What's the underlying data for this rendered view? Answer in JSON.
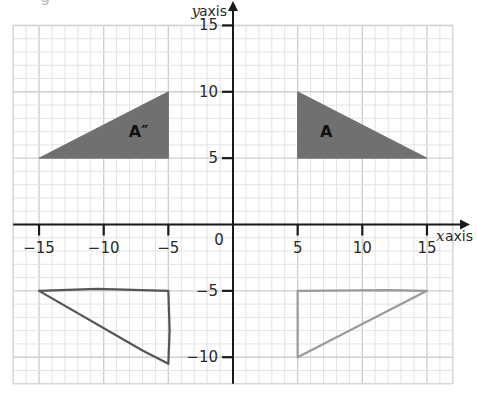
{
  "header": {
    "stray_text": "g"
  },
  "chart_data": {
    "type": "scatter",
    "title": "",
    "xlabel": {
      "var": "x",
      "text": "axis"
    },
    "ylabel": {
      "var": "y",
      "text": "axis"
    },
    "xlim": [
      -17,
      17
    ],
    "ylim": [
      -12,
      15
    ],
    "grid": true,
    "grid_minor_step": 1,
    "grid_major_step": 5,
    "x_ticks": [
      {
        "value": -15,
        "label": "−15"
      },
      {
        "value": -10,
        "label": "−10"
      },
      {
        "value": -5,
        "label": "−5"
      },
      {
        "value": 5,
        "label": "5"
      },
      {
        "value": 10,
        "label": "10"
      },
      {
        "value": 15,
        "label": "15"
      }
    ],
    "y_ticks": [
      {
        "value": 15,
        "label": "15"
      },
      {
        "value": 10,
        "label": "10"
      },
      {
        "value": 5,
        "label": "5"
      },
      {
        "value": -5,
        "label": "−5"
      },
      {
        "value": -10,
        "label": "−10"
      }
    ],
    "origin_label": "0",
    "shapes": [
      {
        "name": "A",
        "label": "A",
        "style": "filled",
        "fill": "#707070",
        "vertices": [
          [
            5,
            10
          ],
          [
            5,
            5
          ],
          [
            15,
            5
          ]
        ],
        "label_pos": [
          7.2,
          6.9
        ]
      },
      {
        "name": "A-double-prime",
        "label": "A″",
        "style": "filled",
        "fill": "#707070",
        "vertices": [
          [
            -15,
            5
          ],
          [
            -5,
            5
          ],
          [
            -5,
            10
          ]
        ],
        "label_pos": [
          -7.3,
          6.9
        ]
      },
      {
        "name": "hand-drawn-left",
        "label": "",
        "style": "outline",
        "stroke": "#555555",
        "vertices": [
          [
            -15,
            -5
          ],
          [
            -10.5,
            -4.85
          ],
          [
            -5,
            -5
          ],
          [
            -4.9,
            -8
          ],
          [
            -5,
            -10.5
          ],
          [
            -7,
            -9.5
          ],
          [
            -15,
            -5
          ]
        ]
      },
      {
        "name": "hand-drawn-right",
        "label": "",
        "style": "outline",
        "stroke": "#9a9a9a",
        "vertices": [
          [
            5,
            -10
          ],
          [
            5,
            -5
          ],
          [
            12,
            -4.95
          ],
          [
            15,
            -5
          ],
          [
            5,
            -10
          ]
        ]
      }
    ]
  }
}
